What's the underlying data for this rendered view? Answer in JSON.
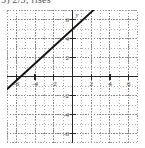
{
  "caption": {
    "text": "5) 2/3; rises"
  },
  "colors": {
    "grid": "#9a9a9a",
    "axis": "#262626",
    "line": "#111111",
    "tick_label": "#3d3d3d",
    "background": "#ffffff",
    "frame": "#8c8c8c"
  },
  "chart_data": {
    "type": "line",
    "title": "",
    "xlabel": "x",
    "ylabel": "y",
    "xlim": [
      -7,
      7
    ],
    "ylim": [
      -7,
      7
    ],
    "grid": true,
    "grid_style": "dotted",
    "grid_step": 1,
    "legend": "none",
    "axis_labels": {
      "x_axis_name": "x",
      "y_axis_name": "y"
    },
    "xticks": [
      -6,
      -4,
      -2,
      2,
      4,
      6
    ],
    "xtick_labels": [
      "-6",
      "-4",
      "-2",
      "2",
      "4",
      "6"
    ],
    "yticks": [
      6,
      4,
      2,
      -2,
      -4,
      -6
    ],
    "ytick_labels": [
      "6",
      "4",
      "2",
      "-2",
      "-4",
      "-6"
    ],
    "series": [
      {
        "name": "line",
        "kind": "straight-line",
        "slope": 1.33,
        "y_intercept": 4,
        "x_intercept": -3,
        "points": [
          {
            "x": -7,
            "y": -1.33
          },
          {
            "x": 2.25,
            "y": 7
          }
        ],
        "equation": "y = 4/3 x + 4"
      }
    ]
  }
}
